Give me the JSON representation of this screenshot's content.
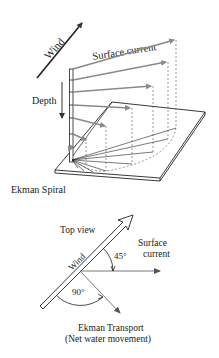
{
  "diagram": {
    "title": "Ekman Spiral",
    "spiral_view": {
      "wind_label": "Wind",
      "surface_current_label": "Surface current",
      "depth_label": "Depth",
      "caption": "Ekman Spiral"
    },
    "top_view": {
      "title": "Top view",
      "wind_label": "Wind",
      "angle_wind_current": "45°",
      "surface_current_line1": "Surface",
      "surface_current_line2": "current",
      "angle_wind_transport": "90°",
      "transport_label_line1": "Ekman Transport",
      "transport_label_line2": "(Net water movement)"
    },
    "colors": {
      "line": "#222222",
      "arrow_gray": "#8a8a8a",
      "background": "#ffffff"
    }
  }
}
